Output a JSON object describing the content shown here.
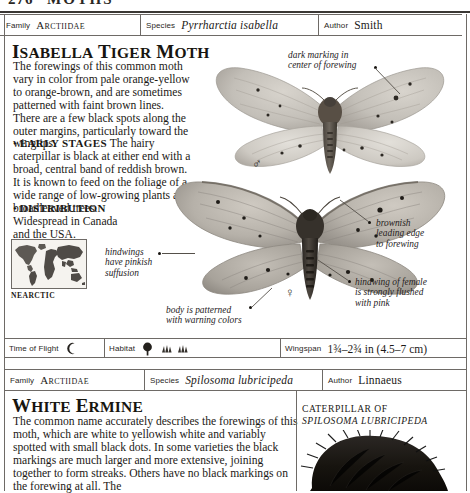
{
  "page": {
    "folio": "276",
    "running_head": "MOTHS"
  },
  "records": [
    {
      "family_label": "Family",
      "family_value": "Arctiidae",
      "species_label": "Species",
      "species_value": "Pyrrharctia isabella",
      "author_label": "Author",
      "author_value": "Smith",
      "headline_first": "I",
      "headline_rest": "SABELLA",
      "headline_word2_first": "T",
      "headline_word2_rest": "IGER",
      "headline_word3_first": "M",
      "headline_word3_rest": "OTH",
      "body_paragraph": "The forewings of this common moth vary in color from pale orange-yellow to orange-brown, and are sometimes patterned with faint brown lines. There are a few black spots along the outer margins, particularly toward the wingtips.",
      "section1_bullet": "•",
      "section1_title": "EARLY STAGES",
      "section1_text": "The hairy caterpillar is black at either end with a broad, central band of reddish brown. It is known to feed on the foliage of a wide range of low-growing plants and broadleaved trees.",
      "section2_bullet": "•",
      "section2_title": "DISTRIBUTION",
      "section2_text": "Widespread in Canada and the USA.",
      "map_label": "NEARCTIC",
      "annotations": [
        "dark marking in\ncenter of forewing",
        "brownish\nleading edge\nto forewing",
        "hindwings\nhave pinkish\nsuffusion",
        "body is patterned\nwith warning colors",
        "hindwing of female\nis strongly flushed\nwith pink"
      ],
      "anno_dark_marking_l1": "dark marking in",
      "anno_dark_marking_l2": "center of forewing",
      "anno_brownish_l1": "brownish",
      "anno_brownish_l2": "leading edge",
      "anno_brownish_l3": "to forewing",
      "anno_hindwings_l1": "hindwings",
      "anno_hindwings_l2": "have pinkish",
      "anno_hindwings_l3": "suffusion",
      "anno_body_l1": "body is patterned",
      "anno_body_l2": "with warning colors",
      "anno_female_l1": "hindwing of female",
      "anno_female_l2": "is strongly flushed",
      "anno_female_l3": "with pink",
      "male_symbol": "♂",
      "female_symbol": "♀",
      "databar": {
        "time_of_flight_label": "Time of Flight",
        "time_of_flight_icon": "crescent-moon-icon",
        "habitat_label": "Habitat",
        "habitat_icons": [
          "broadleaf-tree-icon",
          "grassland-icon",
          "grassland-icon"
        ],
        "wingspan_label": "Wingspan",
        "wingspan_value": "1¾–2¾ in (4.5–7 cm)"
      }
    },
    {
      "family_label": "Family",
      "family_value": "Arctiidae",
      "species_label": "Species",
      "species_value": "Spilosoma lubricipeda",
      "author_label": "Author",
      "author_value": "Linnaeus",
      "headline_first": "W",
      "headline_rest": "HITE",
      "headline_word2_first": "E",
      "headline_word2_rest": "RMINE",
      "body_paragraph": "The common name accurately describes the forewings of this moth, which are white to yellowish white and variably spotted with small black dots. In some varieties the black markings are much larger and more extensive, joining together to form streaks. Others have no black markings on the forewing at all. The",
      "caption_line1": "CATERPILLAR OF",
      "caption_line2": "SPILOSOMA LUBRICIPEDA"
    }
  ],
  "colors": {
    "rule": "#6e6a66",
    "text": "#1b1915",
    "map_land": "#54504b",
    "map_highlight": "#8d8984"
  }
}
